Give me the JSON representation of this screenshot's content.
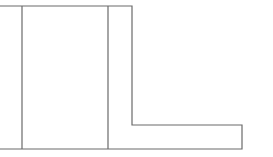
{
  "diagram": {
    "type": "line-drawing",
    "stroke_color": "#6a6a6a",
    "background": "#ffffff",
    "stroke_width": 1.2,
    "outline_points": "0,6 132,6 132,125 242,125 242,149 0,149",
    "inner_lines": [
      {
        "x1": 22,
        "y1": 6,
        "x2": 22,
        "y2": 149
      },
      {
        "x1": 108,
        "y1": 6,
        "x2": 108,
        "y2": 149
      }
    ]
  }
}
